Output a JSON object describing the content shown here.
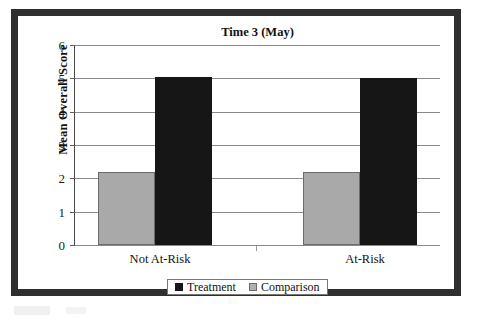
{
  "chart_data": {
    "type": "bar",
    "title": "Time 3 (May)",
    "xlabel": "",
    "ylabel": "Mean Overall Score",
    "categories": [
      "Not At-Risk",
      "At-Risk"
    ],
    "series": [
      {
        "name": "Comparison",
        "values": [
          2.2,
          2.2
        ],
        "color": "#a9a9a9"
      },
      {
        "name": "Treatment",
        "values": [
          5.05,
          5.0
        ],
        "color": "#161616"
      }
    ],
    "ylim": [
      0,
      6
    ],
    "yticks": [
      0,
      1,
      2,
      3,
      4,
      5,
      6
    ],
    "ytick_labels": [
      "0",
      "1",
      "2",
      "3",
      "4",
      "5",
      "6"
    ],
    "grid": "horizontal",
    "legend_position": "bottom",
    "legend_order": [
      "Treatment",
      "Comparison"
    ]
  },
  "legend": {
    "entries": [
      {
        "label": "Treatment",
        "swatch": "black-square-swatch"
      },
      {
        "label": "Comparison",
        "swatch": "gray-square-swatch"
      }
    ]
  }
}
